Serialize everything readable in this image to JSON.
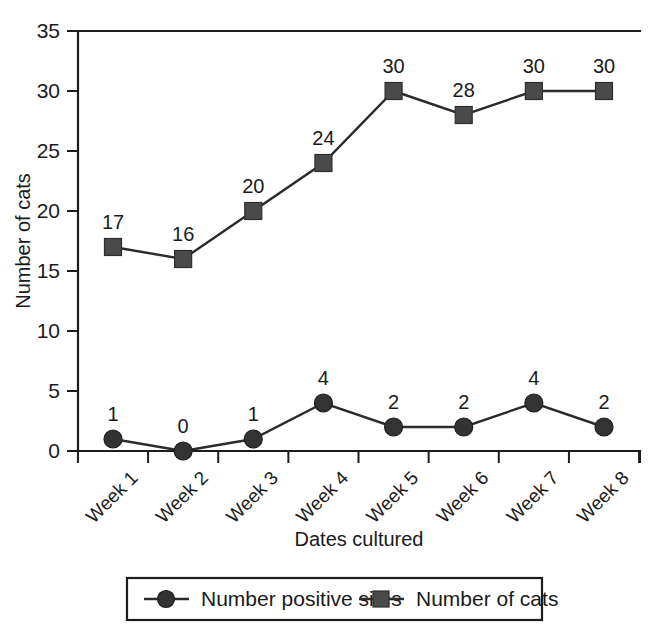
{
  "chart_data": {
    "type": "line",
    "title": "",
    "xlabel": "Dates cultured",
    "ylabel": "Number of cats",
    "categories": [
      "Week 1",
      "Week 2",
      "Week 3",
      "Week 4",
      "Week 5",
      "Week 6",
      "Week 7",
      "Week 8"
    ],
    "ylim": [
      0,
      35
    ],
    "yticks": [
      0,
      5,
      10,
      15,
      20,
      25,
      30,
      35
    ],
    "grid": false,
    "legend_position": "bottom",
    "series": [
      {
        "name": "Number positive sites",
        "marker": "circle",
        "values": [
          1,
          0,
          1,
          4,
          2,
          2,
          4,
          2
        ],
        "labels": [
          "1",
          "0",
          "1",
          "4",
          "2",
          "2",
          "4",
          "2"
        ],
        "color": "#333333"
      },
      {
        "name": "Number of cats",
        "marker": "square",
        "values": [
          17,
          16,
          20,
          24,
          30,
          28,
          30,
          30
        ],
        "labels": [
          "17",
          "16",
          "20",
          "24",
          "30",
          "28",
          "30",
          "30"
        ],
        "color": "#4a4a4a"
      }
    ]
  },
  "axes": {
    "y_tick_labels": [
      "0",
      "5",
      "10",
      "15",
      "20",
      "25",
      "30",
      "35"
    ],
    "x_tick_labels": [
      "Week 1",
      "Week 2",
      "Week 3",
      "Week 4",
      "Week 5",
      "Week 6",
      "Week 7",
      "Week 8"
    ],
    "y_title": "Number of cats",
    "x_title": "Dates cultured"
  },
  "legend": {
    "items": [
      {
        "label": "Number positive sites",
        "marker": "circle-marker"
      },
      {
        "label": "Number of cats",
        "marker": "square-marker"
      }
    ]
  },
  "point_labels": {
    "positive_sites": [
      "1",
      "0",
      "1",
      "4",
      "2",
      "2",
      "4",
      "2"
    ],
    "cats": [
      "17",
      "16",
      "20",
      "24",
      "30",
      "28",
      "30",
      "30"
    ]
  },
  "colors": {
    "axis": "#1c1c1c",
    "series_circle": "#333333",
    "series_square": "#4a4a4a",
    "background": "#ffffff"
  }
}
